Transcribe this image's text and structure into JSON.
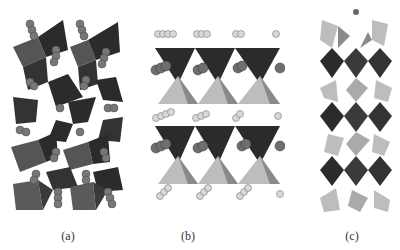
{
  "figure": {
    "panels": [
      {
        "id": "a",
        "label": "(a)",
        "description": "Crystal structure with corner-sharing dark tetrahedra chains and spherical cation columns"
      },
      {
        "id": "b",
        "label": "(b)",
        "description": "Layered structure with inverted dark tetrahedra over light tetrahedra, rows of spheres between layers"
      },
      {
        "id": "c",
        "label": "(c)",
        "description": "Columnar chain of dark octahedra linked by light tetrahedra"
      }
    ],
    "colors": {
      "dark_polyhedra": "#2b2b2b",
      "mid_polyhedra": "#5a5a5a",
      "light_polyhedra": "#bdbdbd",
      "sphere_dark": "#6e6e6e",
      "sphere_light": "#d8d8d8",
      "background": "#ffffff"
    }
  }
}
